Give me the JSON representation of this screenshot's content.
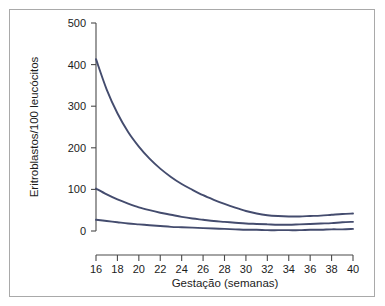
{
  "figure": {
    "frame_color": "#a9a9a9",
    "background": "#ffffff"
  },
  "chart_data": {
    "type": "line",
    "title": "",
    "subtitle": "",
    "xlabel": "Gestação (semanas)",
    "ylabel": "Eritroblastos/100 leucócitos",
    "xlim": [
      16,
      40
    ],
    "ylim": [
      0,
      500
    ],
    "xticks": [
      16,
      18,
      20,
      22,
      24,
      26,
      28,
      30,
      32,
      34,
      36,
      38,
      40
    ],
    "yticks": [
      0,
      100,
      200,
      300,
      400,
      500
    ],
    "xtick_labels": [
      "16",
      "18",
      "20",
      "22",
      "24",
      "26",
      "28",
      "30",
      "32",
      "34",
      "36",
      "38",
      "40"
    ],
    "ytick_labels": [
      "0",
      "100",
      "200",
      "300",
      "400",
      "500"
    ],
    "grid": false,
    "legend": false,
    "legend_position": "none",
    "annotations": [],
    "line_color": "#444c6e",
    "x": [
      16,
      17,
      18,
      19,
      20,
      21,
      22,
      23,
      24,
      25,
      26,
      27,
      28,
      29,
      30,
      31,
      32,
      33,
      34,
      35,
      36,
      37,
      38,
      39,
      40
    ],
    "series": [
      {
        "name": "upper",
        "values": [
          413,
          340,
          283,
          238,
          203,
          174,
          150,
          130,
          113,
          99,
          86,
          75,
          65,
          56,
          48,
          42,
          38,
          36,
          35,
          35,
          36,
          37,
          39,
          41,
          42
        ]
      },
      {
        "name": "median",
        "values": [
          102,
          88,
          76,
          66,
          57,
          50,
          44,
          39,
          34,
          30,
          27,
          24,
          22,
          20,
          18,
          17,
          16,
          15,
          15,
          16,
          17,
          18,
          19,
          21,
          22
        ]
      },
      {
        "name": "lower",
        "values": [
          27,
          24,
          21,
          18,
          16,
          14,
          12,
          10,
          9,
          8,
          7,
          6,
          5,
          4,
          3,
          3,
          2,
          2,
          2,
          2,
          3,
          3,
          4,
          4,
          5
        ]
      }
    ]
  }
}
